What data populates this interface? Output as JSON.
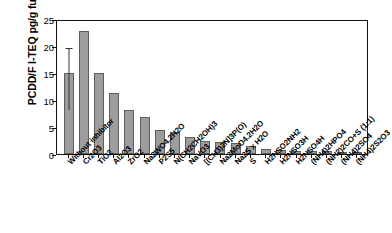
{
  "chart_data": {
    "type": "bar",
    "title": "",
    "xlabel": "",
    "ylabel": "PCDD/F I-TEQ pg/g fuel",
    "ylim": [
      0,
      25
    ],
    "yticks": [
      0,
      5,
      10,
      15,
      20,
      25
    ],
    "grid": false,
    "legend": null,
    "categories": [
      "Without inhibitor",
      "Cr2O3",
      "TiO2",
      "Al2O3",
      "ZrO2",
      "Na2WO4.2H2O",
      "P2S5",
      "N(CH2CH2OH)3",
      "NaVO3",
      "[(CH3)2N]3P(O)",
      "Na2MoO4.2H2O",
      "Na2S x H2O",
      "S",
      "H2NSO2NH2",
      "H2NSO3H",
      "H2NSO4H",
      "(NH4)2HPO4",
      "(NH2)2CO+S (1:1)",
      "(NH4)2SO4",
      "(NH4)2S2O3"
    ],
    "values": [
      15.0,
      22.8,
      15.0,
      11.3,
      8.2,
      6.9,
      4.5,
      4.0,
      3.1,
      2.5,
      2.2,
      2.0,
      1.5,
      1.0,
      0.7,
      0.6,
      0.65,
      0.55,
      0.2,
      0.1
    ],
    "error_bars": [
      {
        "index": 0,
        "low": 8.6,
        "high": 20.0
      }
    ],
    "bar_color": "#9d9d9d",
    "bar_edge_color": "#5d5d5d",
    "axis_color": "#111111"
  }
}
